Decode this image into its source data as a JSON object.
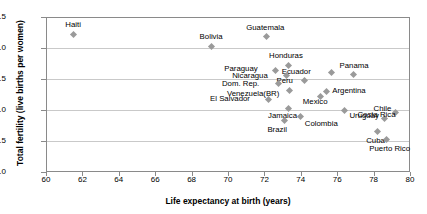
{
  "chart_data": {
    "type": "scatter",
    "title": "",
    "xlabel": "Life expectancy at birth (years)",
    "ylabel": "Total fertility (live births per women)",
    "xlim": [
      60,
      80
    ],
    "ylim": [
      1.0,
      3.5
    ],
    "xticks": [
      60,
      62,
      64,
      66,
      68,
      70,
      72,
      74,
      76,
      78,
      80
    ],
    "yticks": [
      "1.0",
      "1.5",
      "2.0",
      "2.5",
      "3.0",
      "3.5"
    ],
    "grid": "horizontal",
    "legend": "none",
    "marker_color": "#9a9a9a",
    "points": [
      {
        "label": "Haiti",
        "x": 61.5,
        "y": 3.22,
        "lx": -8,
        "ly": -13
      },
      {
        "label": "Bolivia",
        "x": 69.1,
        "y": 3.03,
        "lx": -12,
        "ly": -13
      },
      {
        "label": "Guatemala",
        "x": 72.1,
        "y": 3.18,
        "lx": -20,
        "ly": -13
      },
      {
        "label": "Honduras",
        "x": 73.3,
        "y": 2.72,
        "lx": -19,
        "ly": -13
      },
      {
        "label": "Paraguay",
        "x": 72.6,
        "y": 2.64,
        "lx": -51,
        "ly": -5
      },
      {
        "label": "Ecuador",
        "x": 75.7,
        "y": 2.6,
        "lx": -50,
        "ly": -5
      },
      {
        "label": "Panama",
        "x": 76.9,
        "y": 2.58,
        "lx": -14,
        "ly": -12
      },
      {
        "label": "Nicaragua",
        "x": 73.2,
        "y": 2.55,
        "lx": -54,
        "ly": -4
      },
      {
        "label": "Peru",
        "x": 74.2,
        "y": 2.47,
        "lx": -28,
        "ly": -4
      },
      {
        "label": "Dom. Rep.",
        "x": 72.8,
        "y": 2.42,
        "lx": -57,
        "ly": -4
      },
      {
        "label": "Venezuela(BR)",
        "x": 73.4,
        "y": 2.32,
        "lx": -63,
        "ly": 0
      },
      {
        "label": "Argentina",
        "x": 75.4,
        "y": 2.3,
        "lx": 6,
        "ly": -4
      },
      {
        "label": "Mexico",
        "x": 75.1,
        "y": 2.22,
        "lx": -18,
        "ly": 2
      },
      {
        "label": "El Salvador",
        "x": 72.2,
        "y": 2.17,
        "lx": -58,
        "ly": -4
      },
      {
        "label": "Chile",
        "x": 78.6,
        "y": 1.87,
        "lx": -11,
        "ly": -13
      },
      {
        "label": "Costa Rica",
        "x": 79.2,
        "y": 1.96,
        "lx": -38,
        "ly": -1
      },
      {
        "label": "Jamaica",
        "x": 73.3,
        "y": 2.02,
        "lx": -20,
        "ly": 3
      },
      {
        "label": "Uruguay",
        "x": 76.4,
        "y": 2.0,
        "lx": 5,
        "ly": 2
      },
      {
        "label": "Colombia",
        "x": 74.0,
        "y": 1.9,
        "lx": 4,
        "ly": 4
      },
      {
        "label": "Brazil",
        "x": 73.1,
        "y": 1.83,
        "lx": -17,
        "ly": 5
      },
      {
        "label": "Cuba",
        "x": 78.2,
        "y": 1.65,
        "lx": -11,
        "ly": 5
      },
      {
        "label": "Puerto Rico",
        "x": 78.7,
        "y": 1.52,
        "lx": -17,
        "ly": 5
      }
    ]
  }
}
